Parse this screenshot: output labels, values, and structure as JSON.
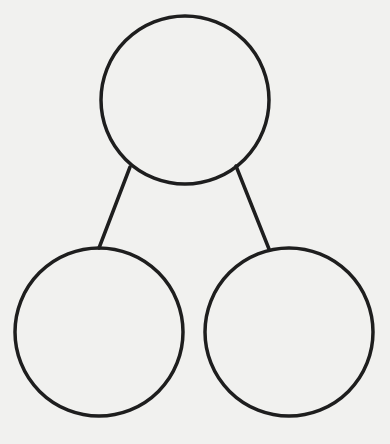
{
  "diagram": {
    "type": "number-bond",
    "background": "#f1f1ef",
    "stroke_color": "#1e1e1e",
    "stroke_width": 3.5,
    "nodes": [
      {
        "id": "whole",
        "cx": 185,
        "cy": 100,
        "r": 84,
        "label": ""
      },
      {
        "id": "part-left",
        "cx": 99,
        "cy": 332,
        "r": 84,
        "label": ""
      },
      {
        "id": "part-right",
        "cx": 289,
        "cy": 332,
        "r": 84,
        "label": ""
      }
    ],
    "edges": [
      {
        "from": "whole",
        "to": "part-left",
        "x1": 130,
        "y1": 167,
        "x2": 99,
        "y2": 248
      },
      {
        "from": "whole",
        "to": "part-right",
        "x1": 236,
        "y1": 166,
        "x2": 269,
        "y2": 249
      }
    ]
  }
}
